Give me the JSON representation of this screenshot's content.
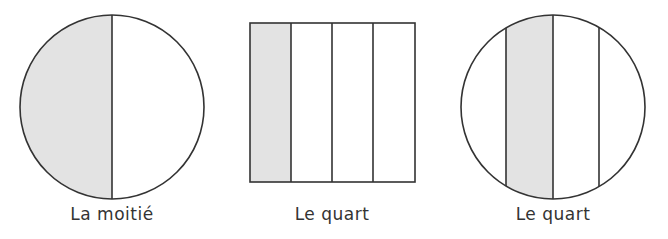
{
  "figures": [
    {
      "shape": "circle",
      "parts": 2,
      "shaded_parts": 1,
      "label": "La moitié"
    },
    {
      "shape": "square",
      "parts": 4,
      "shaded_parts": 1,
      "label": "Le quart"
    },
    {
      "shape": "circle",
      "parts": 4,
      "shaded_parts": 1,
      "label": "Le quart"
    }
  ],
  "colors": {
    "stroke": "#333333",
    "shade": "#e3e3e3",
    "background": "#ffffff"
  }
}
